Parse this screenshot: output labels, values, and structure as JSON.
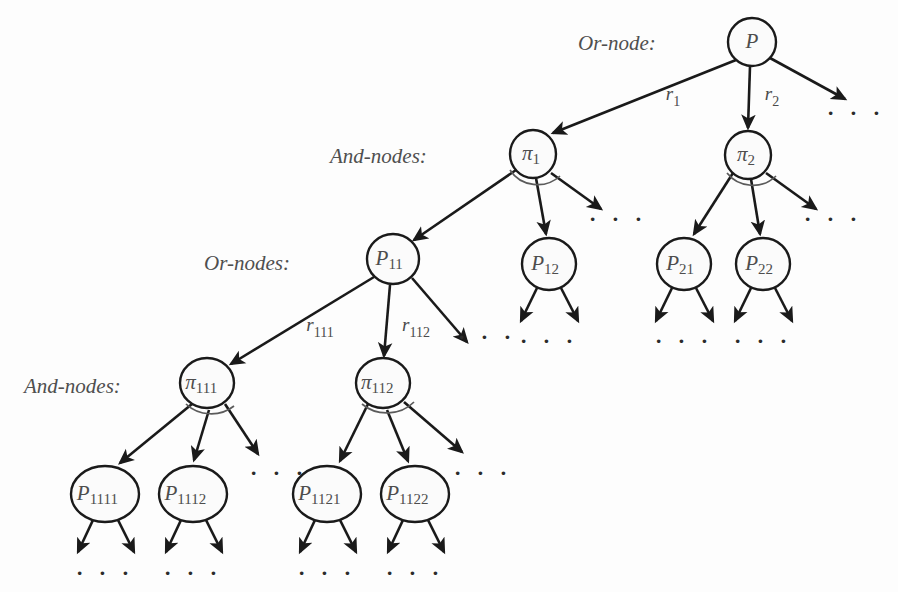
{
  "figure": {
    "type": "and-or-graph-diagram",
    "background_color": "#fdfdfd",
    "stroke_color": "#1a1a1a",
    "text_color": "#4d4d4d",
    "arc_color": "#5b5b5b",
    "width": 898,
    "height": 592
  },
  "row_labels": [
    {
      "id": "row-or-1",
      "text": "Or-node:",
      "x": 578,
      "y": 50
    },
    {
      "id": "row-and-1",
      "text": "And-nodes:",
      "x": 330,
      "y": 163
    },
    {
      "id": "row-or-2",
      "text": "Or-nodes:",
      "x": 204,
      "y": 270
    },
    {
      "id": "row-and-2",
      "text": "And-nodes:",
      "x": 24,
      "y": 393
    }
  ],
  "nodes": [
    {
      "id": "P",
      "kind": "or",
      "base": "P",
      "sub": "",
      "cx": 752,
      "cy": 42,
      "rx": 24,
      "ry": 24
    },
    {
      "id": "pi1",
      "kind": "and",
      "base": "π",
      "sub": "1",
      "cx": 533,
      "cy": 154,
      "rx": 23,
      "ry": 24
    },
    {
      "id": "pi2",
      "kind": "and",
      "base": "π",
      "sub": "2",
      "cx": 748,
      "cy": 155,
      "rx": 23,
      "ry": 24
    },
    {
      "id": "P11",
      "kind": "or",
      "base": "P",
      "sub": "11",
      "cx": 393,
      "cy": 259,
      "rx": 26,
      "ry": 25
    },
    {
      "id": "P12",
      "kind": "or",
      "base": "P",
      "sub": "12",
      "cx": 549,
      "cy": 264,
      "rx": 27,
      "ry": 26
    },
    {
      "id": "P21",
      "kind": "or",
      "base": "P",
      "sub": "21",
      "cx": 684,
      "cy": 264,
      "rx": 27,
      "ry": 26
    },
    {
      "id": "P22",
      "kind": "or",
      "base": "P",
      "sub": "22",
      "cx": 763,
      "cy": 264,
      "rx": 27,
      "ry": 26
    },
    {
      "id": "pi111",
      "kind": "and",
      "base": "π",
      "sub": "111",
      "cx": 207,
      "cy": 383,
      "rx": 27,
      "ry": 25
    },
    {
      "id": "pi112",
      "kind": "and",
      "base": "π",
      "sub": "112",
      "cx": 383,
      "cy": 383,
      "rx": 27,
      "ry": 25
    },
    {
      "id": "P1111",
      "kind": "or",
      "base": "P",
      "sub": "1111",
      "cx": 105,
      "cy": 494,
      "rx": 34,
      "ry": 28
    },
    {
      "id": "P1112",
      "kind": "or",
      "base": "P",
      "sub": "1112",
      "cx": 193,
      "cy": 494,
      "rx": 34,
      "ry": 28
    },
    {
      "id": "P1121",
      "kind": "or",
      "base": "P",
      "sub": "1121",
      "cx": 327,
      "cy": 494,
      "rx": 34,
      "ry": 28
    },
    {
      "id": "P1122",
      "kind": "or",
      "base": "P",
      "sub": "1122",
      "cx": 415,
      "cy": 494,
      "rx": 34,
      "ry": 28
    }
  ],
  "edges": [
    {
      "id": "P-r1",
      "from": "P",
      "to": "pi1",
      "x1": 736,
      "y1": 60,
      "x2": 553,
      "y2": 133,
      "arrow": true
    },
    {
      "id": "P-r2",
      "from": "P",
      "to": "pi2",
      "x1": 750,
      "y1": 66,
      "x2": 748,
      "y2": 128,
      "arrow": true
    },
    {
      "id": "P-r3",
      "from": "P",
      "to": "dots-P",
      "x1": 770,
      "y1": 58,
      "x2": 845,
      "y2": 99,
      "arrow": true
    },
    {
      "id": "pi1-c1",
      "from": "pi1",
      "to": "P11",
      "x1": 516,
      "y1": 170,
      "x2": 414,
      "y2": 240,
      "arrow": true
    },
    {
      "id": "pi1-c2",
      "from": "pi1",
      "to": "P12",
      "x1": 536,
      "y1": 178,
      "x2": 546,
      "y2": 234,
      "arrow": true
    },
    {
      "id": "pi1-c3",
      "from": "pi1",
      "to": "dots-pi1",
      "x1": 551,
      "y1": 173,
      "x2": 601,
      "y2": 209,
      "arrow": true
    },
    {
      "id": "pi2-c1",
      "from": "pi2",
      "to": "P21",
      "x1": 733,
      "y1": 173,
      "x2": 694,
      "y2": 234,
      "arrow": true
    },
    {
      "id": "pi2-c2",
      "from": "pi2",
      "to": "P22",
      "x1": 751,
      "y1": 179,
      "x2": 760,
      "y2": 234,
      "arrow": true
    },
    {
      "id": "pi2-c3",
      "from": "pi2",
      "to": "dots-pi2",
      "x1": 766,
      "y1": 173,
      "x2": 816,
      "y2": 209,
      "arrow": true
    },
    {
      "id": "P11-r111",
      "from": "P11",
      "to": "pi111",
      "x1": 374,
      "y1": 277,
      "x2": 231,
      "y2": 364,
      "arrow": true
    },
    {
      "id": "P11-r112",
      "from": "P11",
      "to": "pi112",
      "x1": 390,
      "y1": 285,
      "x2": 384,
      "y2": 356,
      "arrow": true
    },
    {
      "id": "P11-r113",
      "from": "P11",
      "to": "dots-P11",
      "x1": 412,
      "y1": 278,
      "x2": 467,
      "y2": 342,
      "arrow": true
    },
    {
      "id": "pi111-c1",
      "from": "pi111",
      "to": "P1111",
      "x1": 192,
      "y1": 404,
      "x2": 120,
      "y2": 463,
      "arrow": true
    },
    {
      "id": "pi111-c2",
      "from": "pi111",
      "to": "P1112",
      "x1": 209,
      "y1": 410,
      "x2": 194,
      "y2": 460,
      "arrow": true
    },
    {
      "id": "pi111-c3",
      "from": "pi111",
      "to": "dots-pi111",
      "x1": 225,
      "y1": 404,
      "x2": 258,
      "y2": 454,
      "arrow": true
    },
    {
      "id": "pi112-c1",
      "from": "pi112",
      "to": "P1121",
      "x1": 368,
      "y1": 404,
      "x2": 340,
      "y2": 461,
      "arrow": true
    },
    {
      "id": "pi112-c2",
      "from": "pi112",
      "to": "P1122",
      "x1": 387,
      "y1": 410,
      "x2": 408,
      "y2": 461,
      "arrow": true
    },
    {
      "id": "pi112-c3",
      "from": "pi112",
      "to": "dots-pi112",
      "x1": 404,
      "y1": 402,
      "x2": 462,
      "y2": 452,
      "arrow": true
    },
    {
      "id": "P12-l",
      "from": "P12",
      "to": "dots-P12-l",
      "x1": 537,
      "y1": 288,
      "x2": 521,
      "y2": 321,
      "arrow": true
    },
    {
      "id": "P12-r",
      "from": "P12",
      "to": "dots-P12-r",
      "x1": 561,
      "y1": 288,
      "x2": 578,
      "y2": 321,
      "arrow": true
    },
    {
      "id": "P21-l",
      "from": "P21",
      "to": "dots-P21-l",
      "x1": 672,
      "y1": 288,
      "x2": 656,
      "y2": 321,
      "arrow": true
    },
    {
      "id": "P21-r",
      "from": "P21",
      "to": "dots-P21-r",
      "x1": 696,
      "y1": 288,
      "x2": 713,
      "y2": 321,
      "arrow": true
    },
    {
      "id": "P22-l",
      "from": "P22",
      "to": "dots-P22-l",
      "x1": 751,
      "y1": 288,
      "x2": 735,
      "y2": 321,
      "arrow": true
    },
    {
      "id": "P22-r",
      "from": "P22",
      "to": "dots-P22-r",
      "x1": 775,
      "y1": 288,
      "x2": 792,
      "y2": 321,
      "arrow": true
    },
    {
      "id": "P1111-l",
      "from": "P1111",
      "to": "dots-b1",
      "x1": 93,
      "y1": 520,
      "x2": 78,
      "y2": 552,
      "arrow": true
    },
    {
      "id": "P1111-r",
      "from": "P1111",
      "to": "dots-b1",
      "x1": 118,
      "y1": 520,
      "x2": 134,
      "y2": 552,
      "arrow": true
    },
    {
      "id": "P1112-l",
      "from": "P1112",
      "to": "dots-b2",
      "x1": 181,
      "y1": 520,
      "x2": 166,
      "y2": 552,
      "arrow": true
    },
    {
      "id": "P1112-r",
      "from": "P1112",
      "to": "dots-b2",
      "x1": 206,
      "y1": 520,
      "x2": 222,
      "y2": 552,
      "arrow": true
    },
    {
      "id": "P1121-l",
      "from": "P1121",
      "to": "dots-b3",
      "x1": 315,
      "y1": 520,
      "x2": 300,
      "y2": 552,
      "arrow": true
    },
    {
      "id": "P1121-r",
      "from": "P1121",
      "to": "dots-b3",
      "x1": 340,
      "y1": 520,
      "x2": 356,
      "y2": 552,
      "arrow": true
    },
    {
      "id": "P1122-l",
      "from": "P1122",
      "to": "dots-b4",
      "x1": 403,
      "y1": 520,
      "x2": 388,
      "y2": 552,
      "arrow": true
    },
    {
      "id": "P1122-r",
      "from": "P1122",
      "to": "dots-b4",
      "x1": 428,
      "y1": 520,
      "x2": 444,
      "y2": 552,
      "arrow": true
    }
  ],
  "and_arcs": [
    {
      "id": "arc-pi1",
      "node": "pi1",
      "d": "M 510 170 A 32 30 0 0 0 560 176"
    },
    {
      "id": "arc-pi2",
      "node": "pi2",
      "d": "M 727 173 A 32 30 0 0 0 776 176"
    },
    {
      "id": "arc-pi111",
      "node": "pi111",
      "d": "M 186 404 A 34 30 0 0 0 234 406"
    },
    {
      "id": "arc-pi112",
      "node": "pi112",
      "d": "M 362 404 A 36 32 0 0 0 414 402"
    }
  ],
  "edge_labels": [
    {
      "id": "lbl-r1",
      "base": "r",
      "sub": "1",
      "x": 673,
      "y": 100
    },
    {
      "id": "lbl-r2",
      "base": "r",
      "sub": "2",
      "x": 772,
      "y": 100
    },
    {
      "id": "lbl-r111",
      "base": "r",
      "sub": "111",
      "x": 320,
      "y": 331
    },
    {
      "id": "lbl-r112",
      "base": "r",
      "sub": "112",
      "x": 416,
      "y": 331
    }
  ],
  "ellipses": [
    {
      "id": "dots-P",
      "text": "· · ·",
      "x": 856,
      "y": 120
    },
    {
      "id": "dots-pi1",
      "text": "· · ·",
      "x": 618,
      "y": 226
    },
    {
      "id": "dots-pi2",
      "text": "· · ·",
      "x": 833,
      "y": 226
    },
    {
      "id": "dots-P11",
      "text": "· · ·",
      "x": 487,
      "y": 344
    },
    {
      "id": "dots-P12",
      "text": "· · ·",
      "x": 549,
      "y": 348
    },
    {
      "id": "dots-P21",
      "text": "· · ·",
      "x": 684,
      "y": 348
    },
    {
      "id": "dots-P22",
      "text": "· · ·",
      "x": 763,
      "y": 348
    },
    {
      "id": "dots-pi111",
      "text": "· · ·",
      "x": 279,
      "y": 480
    },
    {
      "id": "dots-pi112",
      "text": "· · ·",
      "x": 483,
      "y": 480
    },
    {
      "id": "dots-b1",
      "text": "· · ·",
      "x": 105,
      "y": 580
    },
    {
      "id": "dots-b2",
      "text": "· · ·",
      "x": 193,
      "y": 580
    },
    {
      "id": "dots-b3",
      "text": "· · ·",
      "x": 327,
      "y": 580
    },
    {
      "id": "dots-b4",
      "text": "· · ·",
      "x": 415,
      "y": 580
    }
  ]
}
